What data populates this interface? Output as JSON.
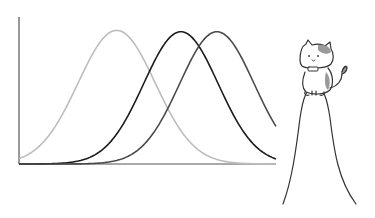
{
  "chart_data": {
    "type": "line",
    "title": "",
    "xlabel": "",
    "ylabel": "",
    "grid": false,
    "legend": null,
    "x_range": [
      0,
      10
    ],
    "y_range": [
      0,
      1.1
    ],
    "series": [
      {
        "name": "curve-light-gray",
        "color": "#bdbdbd",
        "mean": 3.8,
        "sd": 1.5,
        "peak": 1.0,
        "offset": 0.0
      },
      {
        "name": "curve-black",
        "color": "#1a1a1a",
        "mean": 6.3,
        "sd": 1.45,
        "peak": 0.99,
        "offset": 0.0
      },
      {
        "name": "curve-dark-gray",
        "color": "#4a4a4a",
        "mean": 7.7,
        "sd": 1.45,
        "peak": 0.99,
        "offset": 0.0
      }
    ],
    "annotations": [
      {
        "type": "illustration",
        "description": "cartoon calico cat with bow tie sitting on top of a tall narrow bell-curve peak"
      }
    ]
  },
  "illustration": {
    "label": "cat on peak"
  }
}
